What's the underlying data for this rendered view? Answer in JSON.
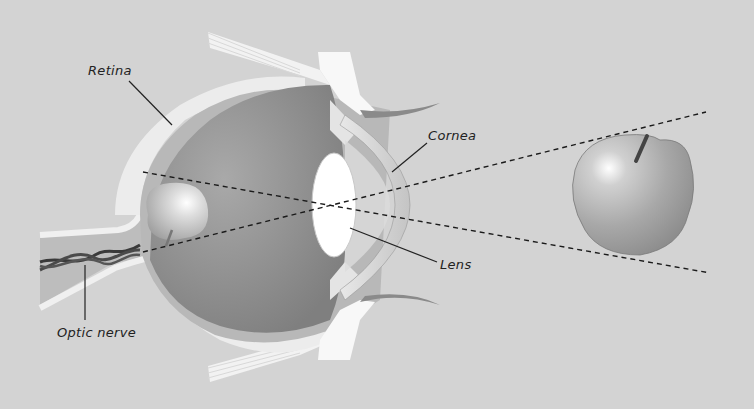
{
  "diagram": {
    "labels": {
      "retina": "Retina",
      "cornea": "Cornea",
      "lens": "Lens",
      "optic_nerve": "Optic nerve"
    },
    "objects": {
      "real_object": "apple",
      "image_on_retina": "inverted apple"
    },
    "colors": {
      "background": "#d3d3d3",
      "eye_interior": "#8e8e8e",
      "sclera": "#ececec",
      "choroid": "#b8b8b8",
      "lens": "#ffffff",
      "ray_lines": "#1a1a1a",
      "apple": "#a8a8a8"
    }
  }
}
